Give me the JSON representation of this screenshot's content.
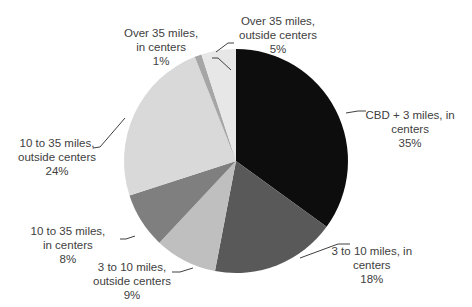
{
  "chart_data": {
    "type": "pie",
    "title": "",
    "start_angle_deg": 0,
    "direction": "clockwise",
    "slices": [
      {
        "label": "CBD + 3 miles, in centers",
        "value": 35,
        "display": "35%",
        "color": "#0d0d0d",
        "lines": [
          "CBD + 3 miles, in",
          "centers",
          "35%"
        ],
        "lx": 410,
        "ly": 108
      },
      {
        "label": "3 to 10 miles, in centers",
        "value": 18,
        "display": "18%",
        "color": "#595959",
        "lines": [
          "3 to 10 miles, in",
          "centers",
          "18%"
        ],
        "lx": 372,
        "ly": 244
      },
      {
        "label": "3 to 10 miles, outside centers",
        "value": 9,
        "display": "9%",
        "color": "#bfbfbf",
        "lines": [
          "3 to 10 miles,",
          "outside centers",
          "9%"
        ],
        "lx": 132,
        "ly": 260
      },
      {
        "label": "10 to 35 miles, in centers",
        "value": 8,
        "display": "8%",
        "color": "#7f7f7f",
        "lines": [
          "10 to 35 miles,",
          "in centers",
          "8%"
        ],
        "lx": 68,
        "ly": 224
      },
      {
        "label": "10 to 35 miles, outside centers",
        "value": 24,
        "display": "24%",
        "color": "#d9d9d9",
        "lines": [
          "10 to 35 miles,",
          "outside centers",
          "24%"
        ],
        "lx": 57,
        "ly": 136
      },
      {
        "label": "Over 35 miles, in centers",
        "value": 1,
        "display": "1%",
        "color": "#a6a6a6",
        "lines": [
          "Over 35 miles,",
          "in centers",
          "1%"
        ],
        "lx": 161,
        "ly": 26
      },
      {
        "label": "Over 35 miles, outside centers",
        "value": 5,
        "display": "5%",
        "color": "#e7e7e7",
        "lines": [
          "Over 35 miles,",
          "outside centers",
          "5%"
        ],
        "lx": 278,
        "ly": 14
      }
    ],
    "leader_lines": [
      [
        [
          346,
          113
        ],
        [
          358,
          111
        ],
        [
          366,
          111
        ]
      ],
      [
        [
          300,
          258
        ],
        [
          338,
          244
        ],
        [
          350,
          244
        ]
      ],
      [
        [
          193,
          268
        ],
        [
          180,
          272
        ],
        [
          172,
          272
        ]
      ],
      [
        [
          135,
          236
        ],
        [
          126,
          239
        ],
        [
          120,
          239
        ]
      ],
      [
        [
          125,
          118
        ],
        [
          100,
          147
        ],
        [
          93,
          148
        ]
      ],
      [
        [
          231,
          70
        ],
        [
          218,
          58
        ],
        [
          212,
          58
        ]
      ],
      [
        [
          216,
          52
        ],
        [
          228,
          43
        ],
        [
          234,
          43
        ]
      ]
    ],
    "center": [
      236,
      161
    ],
    "radius": 112,
    "legend": "none"
  }
}
